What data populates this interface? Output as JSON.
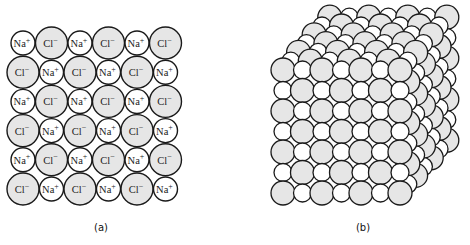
{
  "panels": [
    {
      "id": "a",
      "label": "(a)",
      "description": "2D cross-section of sodium chloride lattice",
      "rows": [
        [
          "Na+",
          "Cl−",
          "Na+",
          "Cl−",
          "Na+",
          "Cl−"
        ],
        [
          "Cl−",
          "Na+",
          "Cl−",
          "Na+",
          "Cl−",
          "Na+"
        ],
        [
          "Na+",
          "Cl−",
          "Na+",
          "Cl−",
          "Na+",
          "Cl−"
        ],
        [
          "Cl−",
          "Na+",
          "Cl−",
          "Na+",
          "Cl−",
          "Na+"
        ],
        [
          "Na+",
          "Cl−",
          "Na+",
          "Cl−",
          "Na+",
          "Cl−"
        ],
        [
          "Cl−",
          "Na+",
          "Cl−",
          "Na+",
          "Cl−",
          "Na+"
        ]
      ],
      "ions": {
        "Na+": {
          "base": "Na",
          "charge": "+",
          "radius": 12,
          "fill": "#ffffff"
        },
        "Cl−": {
          "base": "Cl",
          "charge": "−",
          "radius": 16,
          "fill": "#e6e6e6"
        }
      },
      "layout": {
        "x0": 23,
        "y0": 43,
        "dx": 28.5,
        "dy": 29.2
      }
    },
    {
      "id": "b",
      "label": "(b)",
      "description": "3D sodium chloride crystal lattice (7×7×7)",
      "size": 7,
      "large_radius": 12,
      "small_radius": 9,
      "large_fill": "#e6e6e6",
      "small_fill": "#ffffff",
      "layout": {
        "x0": 283,
        "y0": 70,
        "dx": 19.5,
        "dy": 20.5,
        "depth_dx": 7.8,
        "depth_dy": -8.8
      }
    }
  ],
  "colors": {
    "stroke": "#1a1a1a",
    "chloride_fill": "#e6e6e6",
    "sodium_fill": "#ffffff",
    "background": "#ffffff"
  }
}
